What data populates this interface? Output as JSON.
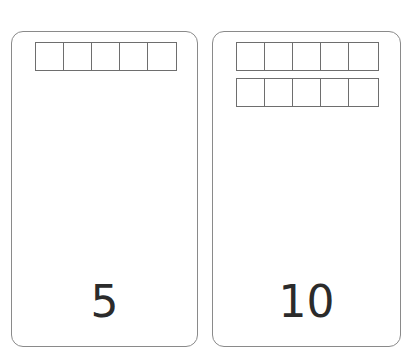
{
  "cards": [
    {
      "number": "5",
      "frames": 1,
      "cells_per_frame": 5
    },
    {
      "number": "10",
      "frames": 2,
      "cells_per_frame": 5
    }
  ],
  "colors": {
    "card_border": "#8a8a8a",
    "frame_line": "#6e6e6e",
    "number_text": "#2b2b2b"
  }
}
